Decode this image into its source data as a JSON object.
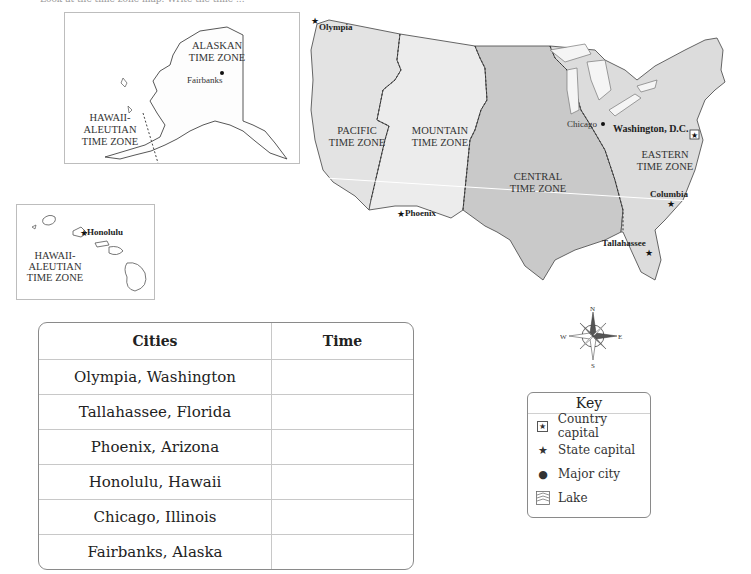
{
  "top_cut_text": "Look at the time zone map. Write the time ...",
  "alaska_inset": {
    "zones": [
      {
        "name": "ALASKAN TIME ZONE",
        "lines": [
          "ALASKAN",
          "TIME ZONE"
        ]
      },
      {
        "name": "HAWAII-ALEUTIAN TIME ZONE",
        "lines": [
          "HAWAII-",
          "ALEUTIAN",
          "TIME ZONE"
        ]
      }
    ],
    "cities": [
      {
        "name": "Fairbanks",
        "type": "major-city"
      }
    ]
  },
  "hawaii_inset": {
    "zone": {
      "lines": [
        "HAWAII-",
        "ALEUTIAN",
        "TIME ZONE"
      ]
    },
    "cities": [
      {
        "name": "Honolulu",
        "type": "state-capital"
      }
    ]
  },
  "main_map": {
    "zones": [
      {
        "id": "pacific",
        "lines": [
          "PACIFIC",
          "TIME ZONE"
        ],
        "color": "#e3e3e3"
      },
      {
        "id": "mountain",
        "lines": [
          "MOUNTAIN",
          "TIME ZONE"
        ],
        "color": "#ececec"
      },
      {
        "id": "central",
        "lines": [
          "CENTRAL",
          "TIME ZONE"
        ],
        "color": "#c9c9c9"
      },
      {
        "id": "eastern",
        "lines": [
          "EASTERN",
          "TIME ZONE"
        ],
        "color": "#dcdcdc"
      }
    ],
    "cities": [
      {
        "name": "Olympia",
        "type": "state-capital"
      },
      {
        "name": "Phoenix",
        "type": "state-capital"
      },
      {
        "name": "Chicago",
        "type": "major-city"
      },
      {
        "name": "Washington, D.C.",
        "type": "country-capital"
      },
      {
        "name": "Columbia",
        "type": "state-capital"
      },
      {
        "name": "Tallahassee",
        "type": "state-capital"
      }
    ]
  },
  "compass": {
    "n": "N",
    "s": "S",
    "e": "E",
    "w": "W"
  },
  "table": {
    "headers": [
      "Cities",
      "Time"
    ],
    "rows": [
      {
        "city": "Olympia, Washington",
        "time": ""
      },
      {
        "city": "Tallahassee, Florida",
        "time": ""
      },
      {
        "city": "Phoenix, Arizona",
        "time": ""
      },
      {
        "city": "Honolulu, Hawaii",
        "time": ""
      },
      {
        "city": "Chicago, Illinois",
        "time": ""
      },
      {
        "city": "Fairbanks, Alaska",
        "time": ""
      }
    ]
  },
  "key": {
    "title": "Key",
    "items": [
      {
        "label": "Country capital",
        "symbol": "boxed-star"
      },
      {
        "label": "State capital",
        "symbol": "star"
      },
      {
        "label": "Major city",
        "symbol": "dot"
      },
      {
        "label": "Lake",
        "symbol": "wave-box"
      }
    ]
  }
}
